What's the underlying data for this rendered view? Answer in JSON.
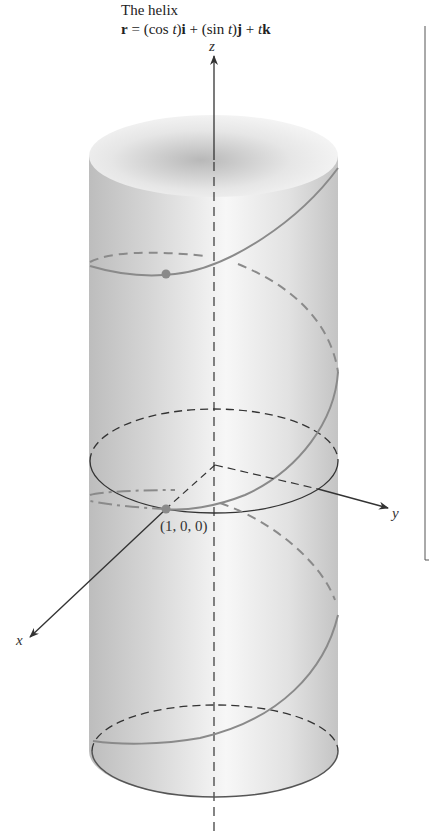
{
  "figure": {
    "title": "The helix",
    "formula": {
      "r": "r",
      "eq": " = (cos ",
      "t1": "t",
      "p1": ")",
      "i": "i",
      "plus1": " + (sin ",
      "t2": "t",
      "p2": ")",
      "j": "j",
      "plus2": " + ",
      "t3": "t",
      "k": "k"
    },
    "axes": {
      "x": "x",
      "y": "y",
      "z": "z"
    },
    "point_label": "(1, 0, 0)",
    "colors": {
      "helix": "#8a8a8a",
      "axes": "#333333",
      "cylinder_light": "#f4f4f4",
      "cylinder_dark": "#c8c8c8",
      "point": "#8a8a8a"
    }
  }
}
